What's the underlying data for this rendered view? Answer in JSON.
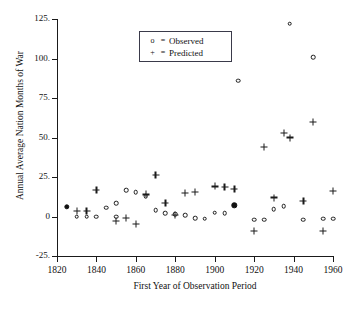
{
  "chart_data": {
    "type": "scatter",
    "title": "",
    "xlabel": "First Year of Observation Period",
    "ylabel": "Annual Average Nation Months of War",
    "xlim": [
      1820,
      1960
    ],
    "ylim": [
      -25,
      125
    ],
    "xticks": [
      "1820",
      "1840",
      "1860",
      "1880",
      "1900",
      "1920",
      "1940",
      "1960"
    ],
    "xtick_values": [
      1820,
      1840,
      1860,
      1880,
      1900,
      1920,
      1940,
      1960
    ],
    "yticks": [
      "125.",
      "100.",
      "75.",
      "50.",
      "25.",
      "0",
      "-25."
    ],
    "ytick_values": [
      125,
      100,
      75,
      50,
      25,
      0,
      -25
    ],
    "grid": false,
    "legend_position": "top-center",
    "legend": [
      {
        "marker": "o",
        "eq": "=",
        "label": "Observed"
      },
      {
        "marker": "+",
        "eq": "=",
        "label": "Predicted"
      }
    ],
    "series": [
      {
        "name": "Observed",
        "marker": "circle-open",
        "points": [
          {
            "x": 1825,
            "y": 6,
            "filled": true
          },
          {
            "x": 1830,
            "y": 0
          },
          {
            "x": 1835,
            "y": 0
          },
          {
            "x": 1840,
            "y": 0
          },
          {
            "x": 1845,
            "y": 5.5
          },
          {
            "x": 1850,
            "y": 8.5
          },
          {
            "x": 1850,
            "y": 0
          },
          {
            "x": 1855,
            "y": 16.5
          },
          {
            "x": 1860,
            "y": 15.5
          },
          {
            "x": 1865,
            "y": 13
          },
          {
            "x": 1870,
            "y": 4
          },
          {
            "x": 1875,
            "y": 2
          },
          {
            "x": 1880,
            "y": 1.5
          },
          {
            "x": 1885,
            "y": 1
          },
          {
            "x": 1890,
            "y": -1
          },
          {
            "x": 1895,
            "y": -1.5
          },
          {
            "x": 1900,
            "y": 2.5
          },
          {
            "x": 1905,
            "y": 2
          },
          {
            "x": 1910,
            "y": 7,
            "filled": true
          },
          {
            "x": 1912,
            "y": 86
          },
          {
            "x": 1920,
            "y": -2
          },
          {
            "x": 1925,
            "y": -2
          },
          {
            "x": 1930,
            "y": 4.5
          },
          {
            "x": 1935,
            "y": 6.5
          },
          {
            "x": 1938,
            "y": 122
          },
          {
            "x": 1945,
            "y": -2
          },
          {
            "x": 1950,
            "y": 101
          },
          {
            "x": 1955,
            "y": -1.5
          },
          {
            "x": 1960,
            "y": -1.5
          }
        ]
      },
      {
        "name": "Predicted",
        "marker": "plus",
        "points": [
          {
            "x": 1830,
            "y": 3.5
          },
          {
            "x": 1835,
            "y": 3.5
          },
          {
            "x": 1840,
            "y": 17
          },
          {
            "x": 1850,
            "y": -3
          },
          {
            "x": 1855,
            "y": -1
          },
          {
            "x": 1860,
            "y": -4.5
          },
          {
            "x": 1865,
            "y": 14
          },
          {
            "x": 1870,
            "y": 26.5
          },
          {
            "x": 1875,
            "y": 8.5
          },
          {
            "x": 1880,
            "y": 1
          },
          {
            "x": 1885,
            "y": 15
          },
          {
            "x": 1890,
            "y": 15.5
          },
          {
            "x": 1900,
            "y": 19
          },
          {
            "x": 1905,
            "y": 18.5
          },
          {
            "x": 1910,
            "y": 17.5
          },
          {
            "x": 1920,
            "y": -9
          },
          {
            "x": 1925,
            "y": 44
          },
          {
            "x": 1930,
            "y": 12
          },
          {
            "x": 1935,
            "y": 53
          },
          {
            "x": 1938,
            "y": 50
          },
          {
            "x": 1945,
            "y": 10
          },
          {
            "x": 1950,
            "y": 60
          },
          {
            "x": 1955,
            "y": -9
          },
          {
            "x": 1960,
            "y": 16
          }
        ]
      }
    ]
  },
  "caption": {
    "text": ""
  }
}
